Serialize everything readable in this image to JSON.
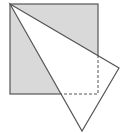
{
  "diagram": {
    "colors": {
      "shade": "#d9d9d9",
      "stroke": "#555555",
      "flap": "#ffffff"
    },
    "square": {
      "x": 10,
      "y": 4,
      "size": 88
    },
    "flap_triangle": {
      "vertices": [
        [
          10,
          4
        ],
        [
          119,
          68
        ],
        [
          82,
          131
        ]
      ]
    },
    "crossings": {
      "right_edge": [
        98,
        55
      ],
      "bottom_edge": [
        61,
        94
      ]
    },
    "dashed_corner": [
      98,
      94
    ]
  }
}
